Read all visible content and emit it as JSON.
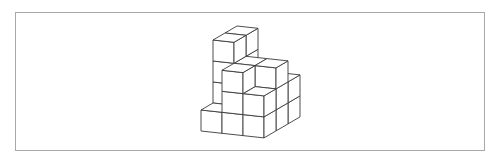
{
  "figure": {
    "stroke_color": "#3a3a3a",
    "face_color": "#ffffff",
    "border_color": "#a8a8a8",
    "projection": {
      "origin": [
        201,
        131
      ],
      "x_axis": [
        21,
        2.3
      ],
      "z_axis": [
        12,
        -7
      ],
      "y_axis": [
        0,
        -21
      ]
    },
    "heights": [
      [
        1,
        3,
        2
      ],
      [
        4,
        3,
        3
      ],
      [
        4,
        2,
        2
      ]
    ]
  }
}
